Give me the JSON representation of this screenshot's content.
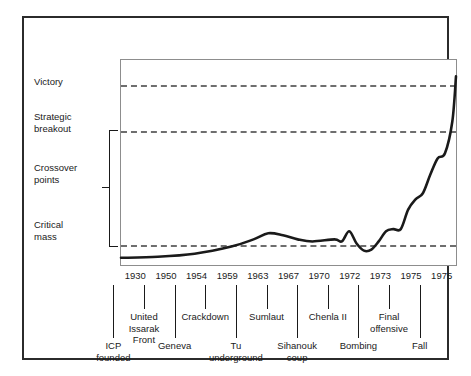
{
  "chart_data": {
    "type": "line",
    "title": "",
    "subtitle": "",
    "xlabel": "",
    "ylabel": "",
    "grid": false,
    "legend_position": "none",
    "y_threshold_labels": [
      {
        "id": "victory",
        "label": "Victory",
        "value": 0.92
      },
      {
        "id": "strategic-breakout",
        "label": "Strategic\nbreakout",
        "value": 0.7
      },
      {
        "id": "crossover-points",
        "label": "Crossover\npoints",
        "value": 0.42
      },
      {
        "id": "critical-mass",
        "label": "Critical\nmass",
        "value": 0.14
      }
    ],
    "x_tick_years": [
      "1930",
      "1950",
      "1954",
      "1959",
      "1963",
      "1967",
      "1970",
      "1972",
      "1973",
      "1975",
      "1975"
    ],
    "x_event_labels": [
      {
        "year": "1930",
        "label": "ICP\nfounded",
        "row": 2
      },
      {
        "year": "1950",
        "label": "United\nIssarak\nFront",
        "row": 1
      },
      {
        "year": "1954",
        "label": "Geneva",
        "row": 2
      },
      {
        "year": "1959",
        "label": "Crackdown",
        "row": 1
      },
      {
        "year": "1963",
        "label": "Tu\nunderground",
        "row": 2
      },
      {
        "year": "1967",
        "label": "Sumlaut",
        "row": 1
      },
      {
        "year": "1970",
        "label": "Sihanouk\ncoup",
        "row": 2
      },
      {
        "year": "1972",
        "label": "Chenla II",
        "row": 1
      },
      {
        "year": "1973",
        "label": "Bombing",
        "row": 2
      },
      {
        "year": "1975",
        "label": "Final\noffensive",
        "row": 1
      },
      {
        "year": "1975",
        "label": "Fall",
        "row": 2
      }
    ],
    "series": [
      {
        "name": "Communist strength",
        "x": [
          1930,
          1935,
          1940,
          1945,
          1948,
          1950,
          1952,
          1954,
          1956,
          1959,
          1960,
          1961,
          1962,
          1963,
          1964,
          1965,
          1966,
          1967,
          1968,
          1969,
          1970,
          1971,
          1972,
          1973,
          1974,
          1975,
          1975.5
        ],
        "values": [
          0.035,
          0.04,
          0.055,
          0.09,
          0.125,
          0.155,
          0.145,
          0.125,
          0.115,
          0.125,
          0.115,
          0.165,
          0.105,
          0.07,
          0.075,
          0.115,
          0.165,
          0.175,
          0.175,
          0.27,
          0.32,
          0.35,
          0.44,
          0.52,
          0.545,
          0.7,
          0.92
        ]
      }
    ],
    "ylim": [
      0,
      1
    ],
    "xlim": [
      1930,
      1975.5
    ],
    "axis_style": "dashed threshold lines; no numeric y axis"
  },
  "accent_colors": {
    "curve": "#1a1a1a",
    "dashed": "#6e6e6e",
    "plot_border": "#8d8d8d",
    "outer_frame": "#2b2b2b",
    "text": "#1a1a1a",
    "background": "#ffffff"
  }
}
